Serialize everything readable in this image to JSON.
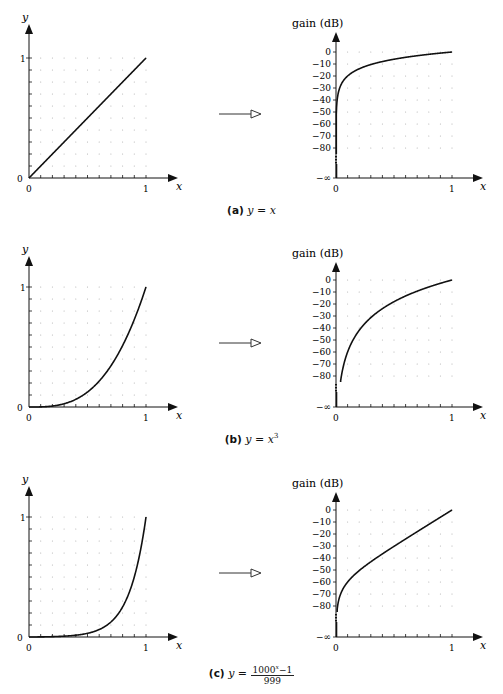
{
  "figure": {
    "panels": [
      {
        "id": "a",
        "caption_label": "(a)",
        "caption_eq": "y = x",
        "caption_sup": "",
        "left_plot": {
          "ylabel": "y",
          "xlabel": "x",
          "yticks": [
            "0",
            "1"
          ],
          "xticks": [
            "0",
            "1"
          ]
        },
        "right_plot": {
          "ylabel": "gain (dB)",
          "xlabel": "x",
          "yticks": [
            "0",
            "−10",
            "−20",
            "−30",
            "−40",
            "−50",
            "−60",
            "−70",
            "−80",
            "−∞"
          ],
          "xticks": [
            "0",
            "1"
          ]
        }
      },
      {
        "id": "b",
        "caption_label": "(b)",
        "caption_eq": "y = x",
        "caption_sup": "3",
        "left_plot": {
          "ylabel": "y",
          "xlabel": "x",
          "yticks": [
            "0",
            "1"
          ],
          "xticks": [
            "0",
            "1"
          ]
        },
        "right_plot": {
          "ylabel": "gain (dB)",
          "xlabel": "x",
          "yticks": [
            "0",
            "−10",
            "−20",
            "−30",
            "−40",
            "−50",
            "−60",
            "−70",
            "−80",
            "−∞"
          ],
          "xticks": [
            "0",
            "1"
          ]
        }
      },
      {
        "id": "c",
        "caption_label": "(c)",
        "caption_eq": "y =",
        "caption_num": "1000",
        "caption_num_sup": "x",
        "caption_num_tail": "−1",
        "caption_den": "999",
        "left_plot": {
          "ylabel": "y",
          "xlabel": "x",
          "yticks": [
            "0",
            "1"
          ],
          "xticks": [
            "0",
            "1"
          ]
        },
        "right_plot": {
          "ylabel": "gain (dB)",
          "xlabel": "x",
          "yticks": [
            "0",
            "−10",
            "−20",
            "−30",
            "−40",
            "−50",
            "−60",
            "−70",
            "−80",
            "−∞"
          ],
          "xticks": [
            "0",
            "1"
          ]
        }
      }
    ]
  },
  "chart_data": [
    {
      "type": "line",
      "title": "(a) y = x — linear",
      "xlabel": "x",
      "ylabel": "y",
      "xlim": [
        0,
        1
      ],
      "ylim": [
        0,
        1
      ],
      "grid": "dotted",
      "x": [
        0,
        0.25,
        0.5,
        0.75,
        1
      ],
      "values": [
        0,
        0.25,
        0.5,
        0.75,
        1
      ]
    },
    {
      "type": "line",
      "title": "(a) y = x — gain",
      "xlabel": "x",
      "ylabel": "gain (dB)",
      "xlim": [
        0,
        1
      ],
      "ylim": [
        -80,
        0
      ],
      "grid": "dotted",
      "x": [
        0.01,
        0.05,
        0.1,
        0.25,
        0.5,
        0.75,
        1
      ],
      "values": [
        -40,
        -26,
        -20,
        -12,
        -6,
        -2.5,
        0
      ]
    },
    {
      "type": "line",
      "title": "(b) y = x^3 — linear",
      "xlabel": "x",
      "ylabel": "y",
      "xlim": [
        0,
        1
      ],
      "ylim": [
        0,
        1
      ],
      "grid": "dotted",
      "x": [
        0,
        0.25,
        0.5,
        0.75,
        1
      ],
      "values": [
        0,
        0.016,
        0.125,
        0.42,
        1
      ]
    },
    {
      "type": "line",
      "title": "(b) y = x^3 — gain",
      "xlabel": "x",
      "ylabel": "gain (dB)",
      "xlim": [
        0,
        1
      ],
      "ylim": [
        -80,
        0
      ],
      "grid": "dotted",
      "x": [
        0.05,
        0.1,
        0.25,
        0.5,
        0.75,
        1
      ],
      "values": [
        -78,
        -60,
        -36,
        -18,
        -7.5,
        0
      ]
    },
    {
      "type": "line",
      "title": "(c) y = (1000^x − 1)/999 — linear",
      "xlabel": "x",
      "ylabel": "y",
      "xlim": [
        0,
        1
      ],
      "ylim": [
        0,
        1
      ],
      "grid": "dotted",
      "x": [
        0,
        0.25,
        0.5,
        0.75,
        1
      ],
      "values": [
        0,
        0.004,
        0.031,
        0.177,
        1
      ]
    },
    {
      "type": "line",
      "title": "(c) y = (1000^x − 1)/999 — gain",
      "xlabel": "x",
      "ylabel": "gain (dB)",
      "xlim": [
        0,
        1
      ],
      "ylim": [
        -80,
        0
      ],
      "grid": "dotted",
      "x": [
        0.01,
        0.05,
        0.1,
        0.25,
        0.5,
        0.75,
        1
      ],
      "values": [
        -80,
        -66,
        -59,
        -47,
        -30,
        -15,
        0
      ]
    }
  ]
}
